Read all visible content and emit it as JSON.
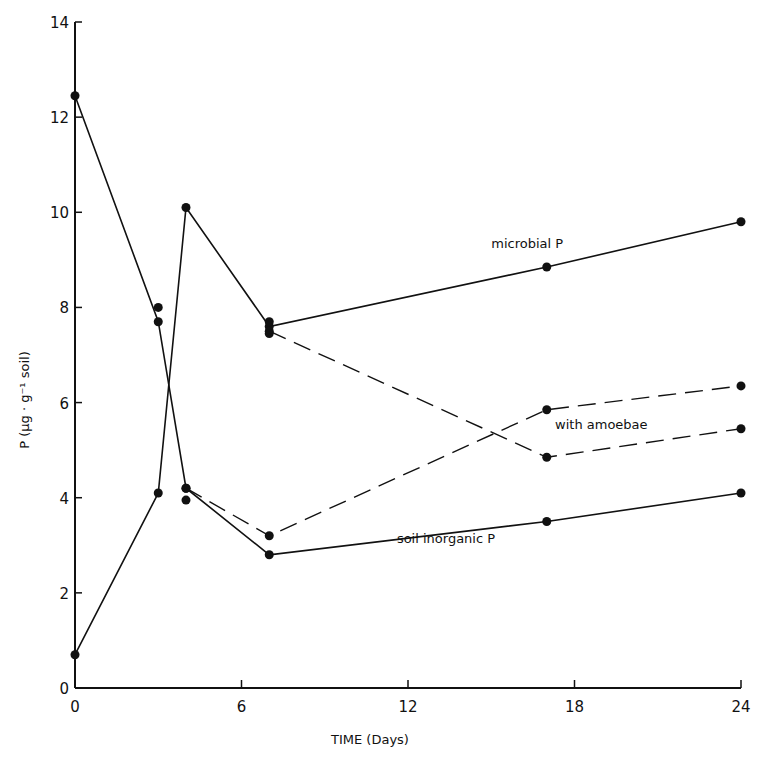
{
  "chart_data": {
    "type": "line",
    "title": "",
    "xlabel": "TIME (Days)",
    "ylabel": "P (µg · g⁻¹ soil)",
    "xlim": [
      0,
      24
    ],
    "ylim": [
      0,
      14
    ],
    "xticks": [
      0,
      6,
      12,
      18,
      24
    ],
    "yticks": [
      0,
      2,
      4,
      6,
      8,
      10,
      12,
      14
    ],
    "grid": false,
    "legend": "inline annotations",
    "annotations": [
      {
        "text": "microbial P",
        "x": 15.0,
        "y": 9.25
      },
      {
        "text": "with amoebae",
        "x": 17.3,
        "y": 5.45
      },
      {
        "text": "soil inorganic P",
        "x": 11.6,
        "y": 3.05
      }
    ],
    "series": [
      {
        "name": "soil inorganic P",
        "style": "solid",
        "x": [
          0,
          3,
          4,
          7,
          17,
          24
        ],
        "y": [
          12.45,
          7.7,
          4.2,
          2.8,
          3.5,
          4.1
        ]
      },
      {
        "name": "microbial P",
        "style": "solid",
        "x": [
          0,
          3,
          4,
          7,
          17,
          24
        ],
        "y": [
          0.7,
          4.1,
          10.1,
          7.6,
          8.85,
          9.8
        ]
      },
      {
        "name": "soil inorganic P with amoebae",
        "style": "dashed",
        "x": [
          4,
          7,
          17,
          24
        ],
        "y": [
          4.2,
          3.2,
          5.85,
          6.35
        ]
      },
      {
        "name": "microbial P with amoebae",
        "style": "dashed",
        "x": [
          7,
          17,
          24
        ],
        "y": [
          7.5,
          4.85,
          5.45
        ]
      }
    ],
    "extra_points": [
      {
        "x": 3,
        "y": 8.0
      },
      {
        "x": 4,
        "y": 3.95
      },
      {
        "x": 7,
        "y": 7.7
      },
      {
        "x": 7,
        "y": 7.45
      }
    ]
  }
}
